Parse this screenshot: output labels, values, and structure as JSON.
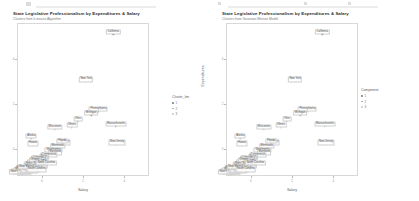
{
  "page": {
    "background": "#ffffff",
    "width": 419,
    "height": 201
  },
  "top_strip": {
    "marks": [
      {
        "x": 26,
        "y": 1,
        "w": 5,
        "h": 4,
        "color": "#dcdcdc"
      },
      {
        "x": 36,
        "y": 5,
        "w": 120,
        "h": 2,
        "color": "#ededed"
      },
      {
        "x": 218,
        "y": 1,
        "w": 3,
        "h": 3,
        "color": "#dcdcdc"
      },
      {
        "x": 228,
        "y": 5,
        "w": 150,
        "h": 2,
        "color": "#ededed"
      },
      {
        "x": 304,
        "y": 1,
        "w": 3,
        "h": 3,
        "color": "#dcdcdc"
      },
      {
        "x": 348,
        "y": 1,
        "w": 3,
        "h": 3,
        "color": "#dcdcdc"
      }
    ]
  },
  "chart_data": [
    {
      "id": "kmeans",
      "type": "scatter",
      "title": "State Legislative Professionalism by Expenditures & Salary",
      "subtitle": "Clusters from k-means Algorithm",
      "xlabel": "Salary",
      "ylabel": "Expenditures",
      "xlim": [
        -1.2,
        5.2
      ],
      "ylim": [
        -1.2,
        5.6
      ],
      "grid": false,
      "legend_position": "right",
      "legend_title": "Cluster_km",
      "xticks": [
        0,
        2,
        4
      ],
      "xticklabels": [
        "0",
        "2",
        "4"
      ],
      "yticks": [
        0,
        2,
        4
      ],
      "yticklabels": [
        "0",
        "2",
        "4"
      ],
      "series": [
        {
          "name": "1",
          "color": "#7b7b7b",
          "points": [
            {
              "label": "California",
              "x": 3.42,
              "y": 5.15
            },
            {
              "label": "New York",
              "x": 2.1,
              "y": 3.02
            },
            {
              "label": "Pennsylvania",
              "x": 2.7,
              "y": 1.7
            },
            {
              "label": "Michigan",
              "x": 2.35,
              "y": 1.55
            },
            {
              "label": "Ohio",
              "x": 1.7,
              "y": 1.28
            },
            {
              "label": "Massachusetts",
              "x": 3.55,
              "y": 1.05
            },
            {
              "label": "Illinois",
              "x": 1.42,
              "y": 1.0
            },
            {
              "label": "New Jersey",
              "x": 3.6,
              "y": 0.22
            }
          ]
        },
        {
          "name": "2",
          "color": "#a8a8a8",
          "points": [
            {
              "label": "Wisconsin",
              "x": 0.58,
              "y": 0.92
            },
            {
              "label": "Alaska",
              "x": -0.55,
              "y": 0.5
            },
            {
              "label": "Hawaii",
              "x": -0.48,
              "y": 0.18
            },
            {
              "label": "Missouri",
              "x": 1.05,
              "y": 0.22
            },
            {
              "label": "Florida",
              "x": 0.95,
              "y": 0.3
            },
            {
              "label": "Minnesota",
              "x": 0.72,
              "y": 0.05
            },
            {
              "label": "Washington",
              "x": 0.52,
              "y": -0.1
            },
            {
              "label": "Maryland",
              "x": 0.6,
              "y": -0.22
            },
            {
              "label": "Connecticut",
              "x": 0.3,
              "y": -0.35
            }
          ]
        },
        {
          "name": "3",
          "color": "#c9c9c9",
          "points": [
            {
              "label": "Texas",
              "x": 0.05,
              "y": -0.42
            },
            {
              "label": "Virginia",
              "x": -0.05,
              "y": -0.52
            },
            {
              "label": "Colorado",
              "x": -0.22,
              "y": -0.48
            },
            {
              "label": "Arizona",
              "x": -0.32,
              "y": -0.58
            },
            {
              "label": "Oklahoma",
              "x": -0.12,
              "y": -0.62
            },
            {
              "label": "Iowa",
              "x": -0.28,
              "y": -0.68
            },
            {
              "label": "Kansas",
              "x": -0.45,
              "y": -0.66
            },
            {
              "label": "Oregon",
              "x": -0.38,
              "y": -0.55
            },
            {
              "label": "Nebraska",
              "x": -0.55,
              "y": -0.72
            },
            {
              "label": "Tennessee",
              "x": -0.15,
              "y": -0.75
            },
            {
              "label": "Georgia",
              "x": -0.05,
              "y": -0.8
            },
            {
              "label": "Indiana",
              "x": -0.25,
              "y": -0.85
            },
            {
              "label": "Kentucky",
              "x": -0.42,
              "y": -0.88
            },
            {
              "label": "Louisiana",
              "x": -0.58,
              "y": -0.82
            },
            {
              "label": "Alabama",
              "x": -0.68,
              "y": -0.9
            },
            {
              "label": "Mississippi",
              "x": -0.8,
              "y": -0.95
            },
            {
              "label": "Arkansas",
              "x": -0.72,
              "y": -1.0
            },
            {
              "label": "West Virginia",
              "x": -0.88,
              "y": -0.92
            },
            {
              "label": "Idaho",
              "x": -0.95,
              "y": -1.02
            },
            {
              "label": "Montana",
              "x": -1.02,
              "y": -0.98
            },
            {
              "label": "South Dakota",
              "x": -1.05,
              "y": -1.05
            },
            {
              "label": "North Dakota",
              "x": -1.0,
              "y": -1.08
            },
            {
              "label": "Wyoming",
              "x": -1.08,
              "y": -1.02
            },
            {
              "label": "New Hampshire",
              "x": -1.1,
              "y": -1.1
            },
            {
              "label": "Vermont",
              "x": -0.92,
              "y": -1.06
            },
            {
              "label": "Maine",
              "x": -0.85,
              "y": -1.04
            },
            {
              "label": "Rhode Island",
              "x": -0.62,
              "y": -1.0
            },
            {
              "label": "Delaware",
              "x": -0.5,
              "y": -0.96
            },
            {
              "label": "Nevada",
              "x": -0.35,
              "y": -0.92
            },
            {
              "label": "Utah",
              "x": -0.45,
              "y": -1.02
            },
            {
              "label": "New Mexico",
              "x": -0.78,
              "y": -0.86
            },
            {
              "label": "South Carolina",
              "x": -0.3,
              "y": -0.98
            },
            {
              "label": "North Carolina",
              "x": 0.18,
              "y": -0.7
            }
          ]
        }
      ]
    },
    {
      "id": "gmm",
      "type": "scatter",
      "title": "State Legislative Professionalism by Expenditures & Salary",
      "subtitle": "Clusters from Gaussian Mixture Model",
      "xlabel": "Salary",
      "ylabel": "Expenditures",
      "xlim": [
        -1.2,
        5.2
      ],
      "ylim": [
        -1.2,
        5.6
      ],
      "grid": false,
      "legend_position": "right",
      "legend_title": "Component",
      "xticks": [
        0,
        2,
        4
      ],
      "xticklabels": [
        "0",
        "2",
        "4"
      ],
      "yticks": [
        0,
        2,
        4
      ],
      "yticklabels": [
        "0",
        "2",
        "4"
      ],
      "series": [
        {
          "name": "1",
          "color": "#7b7b7b",
          "points": [
            {
              "label": "California",
              "x": 3.42,
              "y": 5.15
            },
            {
              "label": "New York",
              "x": 2.1,
              "y": 3.02
            }
          ]
        },
        {
          "name": "2",
          "color": "#a8a8a8",
          "points": [
            {
              "label": "Pennsylvania",
              "x": 2.7,
              "y": 1.7
            },
            {
              "label": "Michigan",
              "x": 2.35,
              "y": 1.55
            },
            {
              "label": "Ohio",
              "x": 1.7,
              "y": 1.28
            },
            {
              "label": "Massachusetts",
              "x": 3.55,
              "y": 1.05
            },
            {
              "label": "Illinois",
              "x": 1.42,
              "y": 1.0
            },
            {
              "label": "New Jersey",
              "x": 3.6,
              "y": 0.22
            },
            {
              "label": "Wisconsin",
              "x": 0.58,
              "y": 0.92
            },
            {
              "label": "Alaska",
              "x": -0.55,
              "y": 0.5
            },
            {
              "label": "Hawaii",
              "x": -0.48,
              "y": 0.18
            }
          ]
        },
        {
          "name": "3",
          "color": "#c9c9c9",
          "points": [
            {
              "label": "Missouri",
              "x": 1.05,
              "y": 0.22
            },
            {
              "label": "Florida",
              "x": 0.95,
              "y": 0.3
            },
            {
              "label": "Minnesota",
              "x": 0.72,
              "y": 0.05
            },
            {
              "label": "Washington",
              "x": 0.52,
              "y": -0.1
            },
            {
              "label": "Maryland",
              "x": 0.6,
              "y": -0.22
            },
            {
              "label": "Connecticut",
              "x": 0.3,
              "y": -0.35
            },
            {
              "label": "Texas",
              "x": 0.05,
              "y": -0.42
            },
            {
              "label": "Virginia",
              "x": -0.05,
              "y": -0.52
            },
            {
              "label": "Colorado",
              "x": -0.22,
              "y": -0.48
            },
            {
              "label": "Arizona",
              "x": -0.32,
              "y": -0.58
            },
            {
              "label": "Oklahoma",
              "x": -0.12,
              "y": -0.62
            },
            {
              "label": "Iowa",
              "x": -0.28,
              "y": -0.68
            },
            {
              "label": "Kansas",
              "x": -0.45,
              "y": -0.66
            },
            {
              "label": "Oregon",
              "x": -0.38,
              "y": -0.55
            },
            {
              "label": "Nebraska",
              "x": -0.55,
              "y": -0.72
            },
            {
              "label": "Tennessee",
              "x": -0.15,
              "y": -0.75
            },
            {
              "label": "Georgia",
              "x": -0.05,
              "y": -0.8
            },
            {
              "label": "Indiana",
              "x": -0.25,
              "y": -0.85
            },
            {
              "label": "Kentucky",
              "x": -0.42,
              "y": -0.88
            },
            {
              "label": "Louisiana",
              "x": -0.58,
              "y": -0.82
            },
            {
              "label": "Alabama",
              "x": -0.68,
              "y": -0.9
            },
            {
              "label": "Mississippi",
              "x": -0.8,
              "y": -0.95
            },
            {
              "label": "Arkansas",
              "x": -0.72,
              "y": -1.0
            },
            {
              "label": "West Virginia",
              "x": -0.88,
              "y": -0.92
            },
            {
              "label": "Idaho",
              "x": -0.95,
              "y": -1.02
            },
            {
              "label": "Montana",
              "x": -1.02,
              "y": -0.98
            },
            {
              "label": "South Dakota",
              "x": -1.05,
              "y": -1.05
            },
            {
              "label": "North Dakota",
              "x": -1.0,
              "y": -1.08
            },
            {
              "label": "Wyoming",
              "x": -1.08,
              "y": -1.02
            },
            {
              "label": "New Hampshire",
              "x": -1.1,
              "y": -1.1
            },
            {
              "label": "Vermont",
              "x": -0.92,
              "y": -1.06
            },
            {
              "label": "Maine",
              "x": -0.85,
              "y": -1.04
            },
            {
              "label": "Rhode Island",
              "x": -0.62,
              "y": -1.0
            },
            {
              "label": "Delaware",
              "x": -0.5,
              "y": -0.96
            },
            {
              "label": "Nevada",
              "x": -0.35,
              "y": -0.92
            },
            {
              "label": "Utah",
              "x": -0.45,
              "y": -1.02
            },
            {
              "label": "New Mexico",
              "x": -0.78,
              "y": -0.86
            },
            {
              "label": "South Carolina",
              "x": -0.3,
              "y": -0.98
            },
            {
              "label": "North Carolina",
              "x": 0.18,
              "y": -0.7
            }
          ]
        }
      ]
    }
  ]
}
